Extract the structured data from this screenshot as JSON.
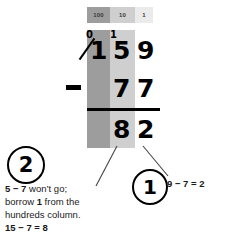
{
  "worksheet": {
    "title": "Column subtraction with borrowing",
    "place_value_header": {
      "hundreds_label": "100",
      "tens_label": "10",
      "ones_label": "1"
    },
    "calculation": {
      "minuend": {
        "hundreds": "1",
        "tens": "5",
        "ones": "9",
        "hundreds_struck": true,
        "hundreds_regrouped_to": "0",
        "tens_carry_mark": "1"
      },
      "operator": "−",
      "subtrahend": {
        "hundreds": "",
        "tens": "7",
        "ones": "7"
      },
      "difference": {
        "hundreds": "",
        "tens": "8",
        "ones": "2"
      }
    },
    "steps": [
      {
        "badge": "1",
        "note": "9 − 7 = 2"
      },
      {
        "badge": "2",
        "note_line1_bold": "5 − 7",
        "note_line1_rest": " won’t go;",
        "note_line2_pre": "borrow ",
        "note_line2_bold": "1",
        "note_line2_post": " from the",
        "note_line3": "hundreds column.",
        "note_line4": "15 − 7 = 8"
      }
    ],
    "colors": {
      "hundreds_shade": "#9d9d9d",
      "tens_shade": "#cfcfcf",
      "ones_shade": "#ebebeb",
      "ink": "#000000",
      "background": "#ffffff"
    }
  }
}
